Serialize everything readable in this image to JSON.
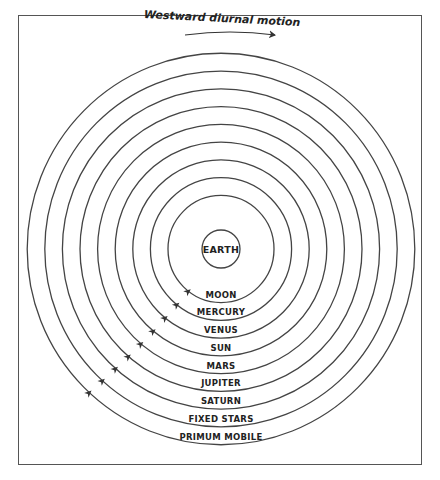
{
  "diagram": {
    "title": "Westward diurnal motion",
    "center_label": "EARTH",
    "spheres": [
      "MOON",
      "MERCURY",
      "VENUS",
      "SUN",
      "MARS",
      "JUPITER",
      "SATURN",
      "FIXED STARS",
      "PRIMUM MOBILE"
    ],
    "caption": "",
    "colors": {
      "line": "#444444",
      "text": "#222222",
      "background": "#ffffff"
    }
  }
}
